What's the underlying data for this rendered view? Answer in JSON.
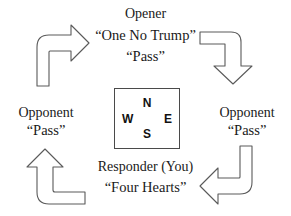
{
  "diagram": {
    "type": "bridge-bidding-rotation",
    "rotation_direction": "clockwise",
    "compass": {
      "north": "N",
      "east": "E",
      "south": "S",
      "west": "W"
    },
    "seats": {
      "north": {
        "role": "Opener",
        "bids": [
          "“One No Trump”",
          "“Pass”"
        ]
      },
      "east": {
        "role": "Opponent",
        "bids": [
          "“Pass”"
        ]
      },
      "south": {
        "role": "Responder (You)",
        "bids": [
          "“Four Hearts”"
        ]
      },
      "west": {
        "role": "Opponent",
        "bids": [
          "“Pass”"
        ]
      }
    },
    "arrows": [
      {
        "name": "arrow-north-to-east",
        "from": "north",
        "to": "east",
        "points": "down"
      },
      {
        "name": "arrow-east-to-south",
        "from": "east",
        "to": "south",
        "points": "left"
      },
      {
        "name": "arrow-south-to-west",
        "from": "south",
        "to": "west",
        "points": "up"
      },
      {
        "name": "arrow-west-to-north",
        "from": "west",
        "to": "north",
        "points": "right"
      }
    ],
    "colors": {
      "background": "#ffffff",
      "text": "#1a1a1a",
      "stroke": "#5a5a5a",
      "box_border": "#4a4a4a"
    }
  }
}
